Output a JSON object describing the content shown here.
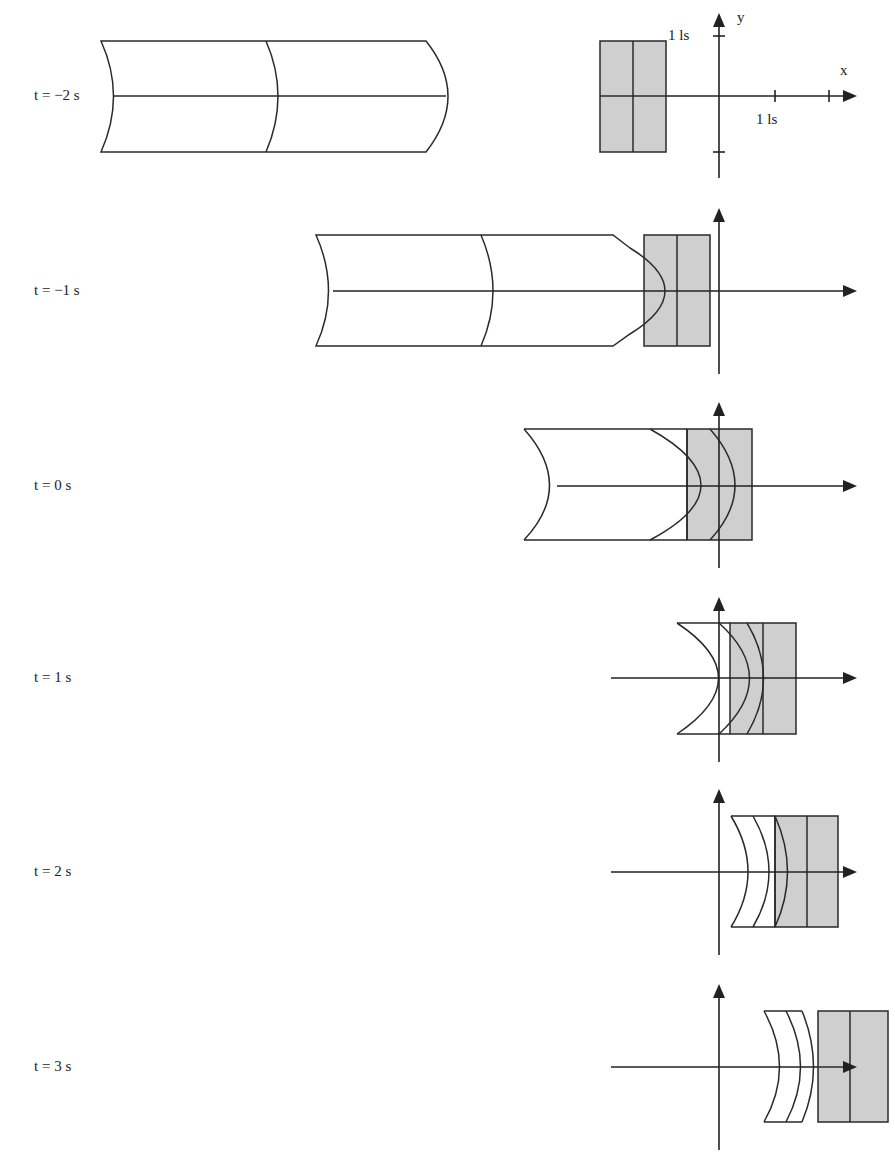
{
  "diagram": {
    "type": "spacetime-snapshots",
    "axes": {
      "x_label": "x",
      "y_label": "y",
      "x_tick_label": "1 ls",
      "y_tick_label": "1 ls"
    },
    "frames": [
      {
        "label": "t = −2 s"
      },
      {
        "label": "t = −1 s"
      },
      {
        "label": "t = 0 s"
      },
      {
        "label": "t = 1 s"
      },
      {
        "label": "t = 2 s"
      },
      {
        "label": "t = 3 s"
      }
    ],
    "colors": {
      "stationary_box": "#cfcfcf",
      "lines": "#2a2a2a",
      "background": "#ffffff"
    }
  }
}
